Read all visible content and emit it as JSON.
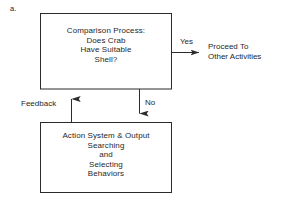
{
  "figure": {
    "panel_caption": "a.",
    "background_color": "#ffffff",
    "line_color": "#2b2b2b",
    "text_color": "#1f1f1f"
  },
  "nodes": {
    "decision_box": {
      "name": "comparison-process-box",
      "lines": [
        "Comparison Process:",
        "Does Crab",
        "Have Suitable",
        "Shell?"
      ],
      "text": "Comparison Process:\nDoes Crab\nHave Suitable\nShell?"
    },
    "action_box": {
      "name": "action-system-box",
      "lines": [
        "Action System & Output",
        "Searching",
        "and",
        "Selecting",
        "Behaviors"
      ],
      "text": "Action System & Output\nSearching\nand\nSelecting\nBehaviors"
    },
    "terminal": {
      "name": "proceed-to-other-activities",
      "lines": [
        "Proceed To",
        "Other Activities"
      ],
      "text": "Proceed To\nOther Activities"
    }
  },
  "edges": {
    "yes": {
      "label": "Yes",
      "from": "comparison-process-box",
      "to": "proceed-to-other-activities"
    },
    "no": {
      "label": "No",
      "from": "comparison-process-box",
      "to": "action-system-box"
    },
    "feedback": {
      "label": "Feedback",
      "from": "action-system-box",
      "to": "comparison-process-box"
    }
  }
}
